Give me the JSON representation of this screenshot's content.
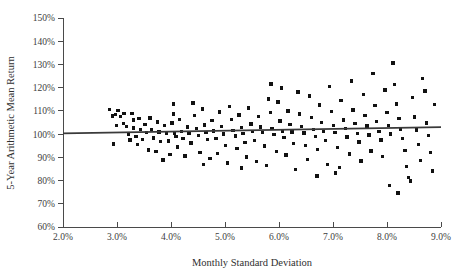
{
  "chart_data": {
    "type": "scatter",
    "title": "",
    "xlabel": "Monthly Standard Deviation",
    "ylabel": "5-Year Arithmetic Mean Return",
    "xlim": [
      2.0,
      9.0
    ],
    "ylim": [
      60,
      150
    ],
    "grid": false,
    "legend": null,
    "x_tick_labels": [
      "2.0%",
      "3.0%",
      "4.0%",
      "5.0%",
      "6.0%",
      "7.0%",
      "8.0%",
      "9.0%"
    ],
    "x_tick_values": [
      2.0,
      3.0,
      4.0,
      5.0,
      6.0,
      7.0,
      8.0,
      9.0
    ],
    "y_tick_labels": [
      "60%",
      "70%",
      "80%",
      "90%",
      "100%",
      "110%",
      "120%",
      "130%",
      "140%",
      "150%"
    ],
    "y_tick_values": [
      60,
      70,
      80,
      90,
      100,
      110,
      120,
      130,
      140,
      150
    ],
    "marker": "square",
    "marker_color": "#111111",
    "trend_line": {
      "label": "linear fit",
      "color": "#3a3a3a",
      "x_start": 2.0,
      "y_start": 100.3,
      "x_end": 9.0,
      "y_end": 103.0
    },
    "points": [
      [
        2.86,
        110.6
      ],
      [
        2.92,
        107.8
      ],
      [
        2.97,
        108.4
      ],
      [
        2.93,
        95.8
      ],
      [
        3.02,
        110.2
      ],
      [
        3.07,
        107.5
      ],
      [
        3.12,
        104.6
      ],
      [
        3.13,
        108.8
      ],
      [
        3.18,
        103.3
      ],
      [
        3.21,
        100.1
      ],
      [
        3.24,
        97.4
      ],
      [
        3.28,
        109.0
      ],
      [
        3.31,
        102.6
      ],
      [
        3.35,
        99.0
      ],
      [
        3.38,
        95.5
      ],
      [
        3.41,
        106.8
      ],
      [
        3.44,
        101.9
      ],
      [
        3.47,
        97.8
      ],
      [
        3.52,
        104.2
      ],
      [
        3.55,
        100.6
      ],
      [
        3.58,
        93.2
      ],
      [
        3.61,
        107.0
      ],
      [
        3.64,
        102.0
      ],
      [
        3.68,
        98.4
      ],
      [
        3.72,
        92.6
      ],
      [
        3.75,
        105.3
      ],
      [
        3.78,
        100.9
      ],
      [
        3.81,
        96.7
      ],
      [
        3.85,
        88.9
      ],
      [
        3.88,
        103.6
      ],
      [
        3.92,
        100.2
      ],
      [
        3.95,
        97.0
      ],
      [
        3.98,
        91.3
      ],
      [
        4.02,
        104.8
      ],
      [
        4.06,
        100.4
      ],
      [
        4.09,
        99.1
      ],
      [
        4.12,
        94.5
      ],
      [
        4.16,
        106.2
      ],
      [
        4.19,
        101.0
      ],
      [
        4.22,
        98.2
      ],
      [
        4.26,
        90.6
      ],
      [
        4.3,
        103.1
      ],
      [
        4.33,
        100.5
      ],
      [
        4.37,
        96.1
      ],
      [
        4.41,
        113.4
      ],
      [
        4.44,
        108.0
      ],
      [
        4.47,
        102.3
      ],
      [
        4.51,
        99.4
      ],
      [
        4.54,
        92.0
      ],
      [
        4.58,
        110.8
      ],
      [
        4.62,
        104.0
      ],
      [
        4.65,
        100.7
      ],
      [
        4.68,
        97.6
      ],
      [
        4.72,
        89.4
      ],
      [
        4.76,
        105.9
      ],
      [
        4.79,
        101.3
      ],
      [
        4.83,
        98.0
      ],
      [
        4.86,
        91.7
      ],
      [
        4.9,
        109.5
      ],
      [
        4.94,
        103.4
      ],
      [
        4.97,
        100.0
      ],
      [
        5.01,
        95.2
      ],
      [
        5.05,
        87.6
      ],
      [
        5.08,
        112.0
      ],
      [
        5.12,
        106.4
      ],
      [
        5.15,
        101.6
      ],
      [
        5.19,
        99.2
      ],
      [
        5.22,
        93.8
      ],
      [
        5.26,
        108.2
      ],
      [
        5.3,
        102.8
      ],
      [
        5.33,
        100.3
      ],
      [
        5.37,
        96.4
      ],
      [
        5.4,
        90.1
      ],
      [
        5.44,
        111.2
      ],
      [
        5.48,
        104.4
      ],
      [
        5.51,
        101.1
      ],
      [
        5.55,
        97.3
      ],
      [
        5.58,
        88.2
      ],
      [
        5.62,
        107.6
      ],
      [
        5.66,
        103.0
      ],
      [
        5.69,
        100.8
      ],
      [
        5.73,
        94.9
      ],
      [
        5.77,
        86.4
      ],
      [
        5.8,
        115.1
      ],
      [
        5.84,
        109.2
      ],
      [
        5.87,
        102.5
      ],
      [
        5.91,
        99.8
      ],
      [
        5.95,
        92.4
      ],
      [
        5.98,
        113.8
      ],
      [
        6.02,
        105.6
      ],
      [
        6.06,
        101.4
      ],
      [
        6.09,
        98.6
      ],
      [
        6.13,
        91.0
      ],
      [
        6.17,
        110.0
      ],
      [
        6.2,
        104.1
      ],
      [
        6.24,
        100.9
      ],
      [
        6.27,
        96.0
      ],
      [
        6.31,
        84.8
      ],
      [
        6.35,
        118.2
      ],
      [
        6.38,
        108.6
      ],
      [
        6.42,
        103.2
      ],
      [
        6.46,
        100.4
      ],
      [
        6.49,
        95.1
      ],
      [
        6.53,
        89.0
      ],
      [
        6.57,
        116.4
      ],
      [
        6.6,
        107.2
      ],
      [
        6.64,
        102.1
      ],
      [
        6.68,
        99.0
      ],
      [
        6.71,
        93.4
      ],
      [
        6.75,
        112.6
      ],
      [
        6.79,
        105.0
      ],
      [
        6.82,
        101.2
      ],
      [
        6.86,
        97.2
      ],
      [
        6.9,
        87.0
      ],
      [
        6.93,
        120.4
      ],
      [
        6.97,
        109.8
      ],
      [
        7.01,
        103.8
      ],
      [
        7.04,
        100.6
      ],
      [
        7.08,
        94.2
      ],
      [
        7.12,
        85.6
      ],
      [
        7.15,
        114.6
      ],
      [
        7.19,
        106.0
      ],
      [
        7.23,
        102.4
      ],
      [
        7.26,
        98.8
      ],
      [
        7.3,
        91.5
      ],
      [
        7.34,
        122.8
      ],
      [
        7.37,
        110.4
      ],
      [
        7.41,
        104.5
      ],
      [
        7.45,
        100.2
      ],
      [
        7.48,
        96.6
      ],
      [
        7.52,
        88.4
      ],
      [
        7.56,
        117.0
      ],
      [
        7.59,
        108.1
      ],
      [
        7.63,
        103.5
      ],
      [
        7.67,
        99.6
      ],
      [
        7.7,
        92.8
      ],
      [
        7.74,
        126.2
      ],
      [
        7.78,
        112.2
      ],
      [
        7.81,
        105.4
      ],
      [
        7.85,
        101.0
      ],
      [
        7.89,
        97.5
      ],
      [
        7.92,
        90.4
      ],
      [
        7.96,
        119.0
      ],
      [
        8.0,
        109.4
      ],
      [
        8.03,
        103.7
      ],
      [
        8.07,
        100.1
      ],
      [
        8.11,
        130.6
      ],
      [
        8.14,
        121.4
      ],
      [
        8.18,
        113.0
      ],
      [
        8.22,
        106.6
      ],
      [
        8.25,
        102.2
      ],
      [
        8.29,
        98.1
      ],
      [
        8.33,
        93.0
      ],
      [
        8.36,
        86.0
      ],
      [
        8.4,
        81.4
      ],
      [
        8.44,
        79.8
      ],
      [
        8.47,
        115.8
      ],
      [
        8.51,
        107.4
      ],
      [
        8.55,
        101.8
      ],
      [
        8.58,
        95.6
      ],
      [
        8.62,
        88.6
      ],
      [
        8.66,
        124.0
      ],
      [
        8.7,
        118.6
      ],
      [
        8.73,
        104.8
      ],
      [
        8.77,
        99.4
      ],
      [
        8.81,
        92.2
      ],
      [
        8.84,
        84.2
      ],
      [
        8.88,
        112.8
      ],
      [
        4.05,
        113.0
      ],
      [
        4.05,
        108.6
      ],
      [
        5.85,
        121.6
      ],
      [
        6.05,
        119.8
      ],
      [
        3.3,
        106.0
      ],
      [
        2.99,
        103.8
      ],
      [
        6.7,
        82.0
      ],
      [
        7.05,
        83.2
      ],
      [
        5.3,
        85.4
      ],
      [
        4.6,
        86.8
      ],
      [
        8.05,
        77.8
      ],
      [
        8.2,
        74.6
      ]
    ]
  }
}
